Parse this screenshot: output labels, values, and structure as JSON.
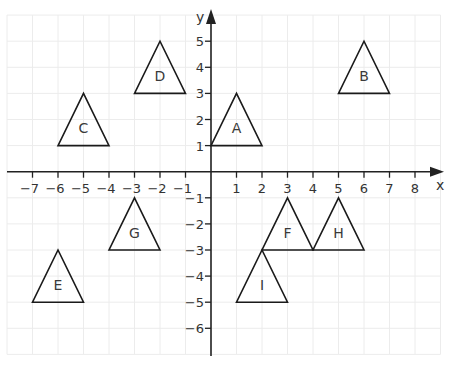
{
  "chart_data": {
    "type": "scatter",
    "title": "",
    "xlabel": "x",
    "ylabel": "y",
    "xlim": [
      -8,
      9
    ],
    "ylim": [
      -7,
      6
    ],
    "grid": true,
    "x_ticks": [
      -7,
      -6,
      -5,
      -4,
      -3,
      -2,
      -1,
      1,
      2,
      3,
      4,
      5,
      6,
      7,
      8
    ],
    "y_ticks": [
      -6,
      -5,
      -4,
      -3,
      -2,
      -1,
      1,
      2,
      3,
      4,
      5
    ],
    "shapes": [
      {
        "label": "A",
        "vertices": [
          [
            0,
            1
          ],
          [
            2,
            1
          ],
          [
            1,
            3
          ]
        ]
      },
      {
        "label": "B",
        "vertices": [
          [
            5,
            3
          ],
          [
            7,
            3
          ],
          [
            6,
            5
          ]
        ]
      },
      {
        "label": "C",
        "vertices": [
          [
            -6,
            1
          ],
          [
            -4,
            1
          ],
          [
            -5,
            3
          ]
        ]
      },
      {
        "label": "D",
        "vertices": [
          [
            -3,
            3
          ],
          [
            -1,
            3
          ],
          [
            -2,
            5
          ]
        ]
      },
      {
        "label": "E",
        "vertices": [
          [
            -7,
            -5
          ],
          [
            -5,
            -5
          ],
          [
            -6,
            -3
          ]
        ]
      },
      {
        "label": "F",
        "vertices": [
          [
            2,
            -3
          ],
          [
            4,
            -3
          ],
          [
            3,
            -1
          ]
        ]
      },
      {
        "label": "G",
        "vertices": [
          [
            -4,
            -3
          ],
          [
            -2,
            -3
          ],
          [
            -3,
            -1
          ]
        ]
      },
      {
        "label": "H",
        "vertices": [
          [
            4,
            -3
          ],
          [
            6,
            -3
          ],
          [
            5,
            -1
          ]
        ]
      },
      {
        "label": "I",
        "vertices": [
          [
            1,
            -5
          ],
          [
            3,
            -5
          ],
          [
            2,
            -3
          ]
        ]
      }
    ]
  },
  "axes": {
    "x_label": "x",
    "y_label": "y"
  },
  "colors": {
    "grid": "#ececec",
    "axis": "#222222",
    "shape_stroke": "#1a1a1a",
    "text": "#333333"
  }
}
